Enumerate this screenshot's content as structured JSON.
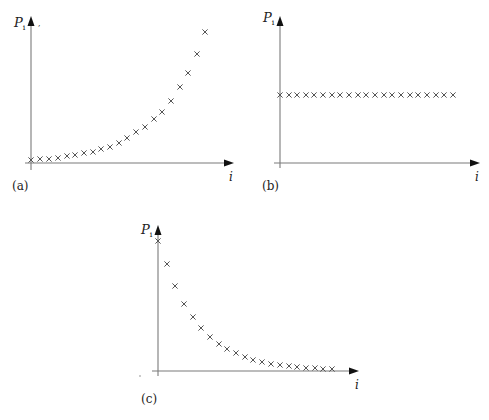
{
  "chart_data": [
    {
      "type": "scatter",
      "panel_label": "(a)",
      "ylabel": "P_i",
      "ylabel_main": "P",
      "ylabel_sub": "i",
      "xlabel": "i",
      "description": "Exponentially increasing P_i",
      "marker": "x",
      "x": [
        1,
        2,
        3,
        4,
        5,
        6,
        7,
        8,
        9,
        10,
        11,
        12,
        13,
        14,
        15,
        16,
        17,
        18,
        19,
        20,
        21
      ],
      "values": [
        0.02,
        0.03,
        0.03,
        0.04,
        0.05,
        0.06,
        0.07,
        0.08,
        0.1,
        0.12,
        0.14,
        0.18,
        0.22,
        0.26,
        0.31,
        0.36,
        0.43,
        0.53,
        0.63,
        0.76,
        0.91
      ],
      "px_x": [
        31,
        40,
        49,
        58,
        67,
        75,
        84,
        93,
        101,
        110,
        119,
        127,
        136,
        145,
        154,
        162,
        171,
        180,
        188,
        197,
        205
      ],
      "px_y": [
        160,
        159,
        159,
        158,
        156,
        155,
        153,
        152,
        149,
        147,
        143,
        138,
        132,
        127,
        119,
        112,
        101,
        87,
        73,
        54,
        32
      ],
      "axes": {
        "origin": [
          31,
          163
        ],
        "y_top": 17,
        "x_end": 233
      }
    },
    {
      "type": "scatter",
      "panel_label": "(b)",
      "ylabel": "P_i",
      "ylabel_main": "P",
      "ylabel_sub": "i",
      "xlabel": "i",
      "description": "Constant P_i",
      "marker": "x",
      "x": [
        1,
        2,
        3,
        4,
        5,
        6,
        7,
        8,
        9,
        10,
        11,
        12,
        13,
        14,
        15,
        16,
        17,
        18,
        19,
        20,
        21
      ],
      "values": [
        0.47,
        0.47,
        0.47,
        0.47,
        0.47,
        0.47,
        0.47,
        0.47,
        0.47,
        0.47,
        0.47,
        0.47,
        0.47,
        0.47,
        0.47,
        0.47,
        0.47,
        0.47,
        0.47,
        0.47,
        0.47
      ],
      "px_x": [
        280,
        289,
        297,
        306,
        314,
        323,
        332,
        340,
        349,
        358,
        366,
        375,
        384,
        392,
        401,
        410,
        418,
        427,
        436,
        444,
        453
      ],
      "px_y": [
        95,
        95,
        95,
        95,
        95,
        95,
        95,
        95,
        95,
        95,
        95,
        95,
        95,
        95,
        95,
        95,
        95,
        95,
        95,
        95,
        95
      ],
      "axes": {
        "origin": [
          280,
          163
        ],
        "y_top": 17,
        "x_end": 479
      }
    },
    {
      "type": "scatter",
      "panel_label": "(c)",
      "ylabel": "P_i",
      "ylabel_main": "P",
      "ylabel_sub": "i",
      "xlabel": "i",
      "description": "Exponentially decreasing P_i",
      "marker": "x",
      "x": [
        1,
        2,
        3,
        4,
        5,
        6,
        7,
        8,
        9,
        10,
        11,
        12,
        13,
        14,
        15,
        16,
        17,
        18,
        19,
        20,
        21
      ],
      "values": [
        0.92,
        0.75,
        0.59,
        0.46,
        0.37,
        0.29,
        0.22,
        0.17,
        0.14,
        0.11,
        0.08,
        0.06,
        0.05,
        0.03,
        0.03,
        0.02,
        0.01,
        0.01,
        0.01,
        0.01,
        0.01
      ],
      "px_x": [
        158,
        167,
        175,
        184,
        193,
        201,
        210,
        219,
        227,
        236,
        245,
        253,
        262,
        271,
        280,
        289,
        297,
        306,
        315,
        323,
        332
      ],
      "px_y": [
        241,
        264,
        286,
        304,
        317,
        328,
        337,
        344,
        349,
        353,
        357,
        360,
        362,
        364,
        365,
        366,
        367,
        368,
        368,
        369,
        369
      ],
      "axes": {
        "origin": [
          158,
          371
        ],
        "y_top": 226,
        "x_end": 358
      }
    }
  ],
  "colors": {
    "axis": "#7a7a7a",
    "arrow": "#111111",
    "marker": "#555555",
    "text": "#222222"
  }
}
